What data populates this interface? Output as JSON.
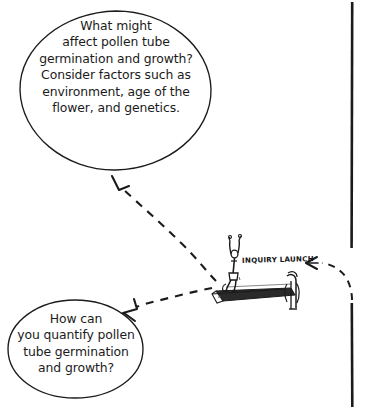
{
  "diagram": {
    "title_concept": "Inquiry launch concept map",
    "background_color": "#ffffff",
    "ink_color": "#1b1b1b",
    "bubbles": [
      {
        "id": "bubble-top",
        "text": "What might\naffect pollen tube\ngermination and growth?\nConsider factors such as\nenvironment, age of the\nflower, and genetics.",
        "shape": "ellipse"
      },
      {
        "id": "bubble-bottom",
        "text": "How can\nyou quantify pollen\ntube germination\nand growth?",
        "shape": "ellipse"
      }
    ],
    "center_node": {
      "label": "INQUIRY LAUNCH",
      "sketch_name": "diver-on-springboard"
    },
    "connectors": [
      {
        "id": "connector-to-top-bubble",
        "style": "dashed",
        "arrow": "open-v",
        "direction": "up-left"
      },
      {
        "id": "connector-to-bottom-bubble",
        "style": "dashed",
        "arrow": "open-v",
        "direction": "down-left"
      },
      {
        "id": "connector-from-right-edge",
        "style": "dashed",
        "arrow": "open-v",
        "direction": "left"
      }
    ],
    "divider": {
      "id": "page-border-line",
      "orientation": "vertical",
      "color": "#1b1b1b"
    }
  }
}
